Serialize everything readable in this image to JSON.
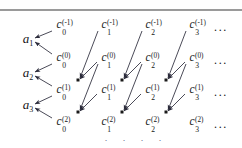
{
  "figure": {
    "width": 242,
    "height": 148,
    "background": "#ffffff",
    "rule_color": "#9a9a9a",
    "ink_color": "#161616",
    "arrow_color": "#2a2a3a"
  },
  "a_nodes": [
    {
      "id": "a1",
      "base": "a",
      "sub": "1",
      "x": 28,
      "y": 40
    },
    {
      "id": "a2",
      "base": "a",
      "sub": "2",
      "x": 28,
      "y": 74
    },
    {
      "id": "a3",
      "base": "a",
      "sub": "3",
      "x": 28,
      "y": 106
    }
  ],
  "c_columns": [
    {
      "col": 0,
      "x": 59
    },
    {
      "col": 1,
      "x": 104
    },
    {
      "col": 2,
      "x": 148
    },
    {
      "col": 3,
      "x": 192
    }
  ],
  "c_rows": [
    {
      "sup": "(-1)",
      "y": 25
    },
    {
      "sup": "(0)",
      "y": 58
    },
    {
      "sup": "(1)",
      "y": 90
    },
    {
      "sup": "(2)",
      "y": 122
    }
  ],
  "c_nodes": [
    {
      "id": "c0_-1",
      "base": "c",
      "sub": "0",
      "sup": "(-1)",
      "x": 59,
      "y": 25
    },
    {
      "id": "c1_-1",
      "base": "c",
      "sub": "1",
      "sup": "(-1)",
      "x": 104,
      "y": 25
    },
    {
      "id": "c2_-1",
      "base": "c",
      "sub": "2",
      "sup": "(-1)",
      "x": 148,
      "y": 25
    },
    {
      "id": "c3_-1",
      "base": "c",
      "sub": "3",
      "sup": "(-1)",
      "x": 192,
      "y": 25
    },
    {
      "id": "c0_0",
      "base": "c",
      "sub": "0",
      "sup": "(0)",
      "x": 59,
      "y": 58
    },
    {
      "id": "c1_0",
      "base": "c",
      "sub": "1",
      "sup": "(0)",
      "x": 104,
      "y": 58
    },
    {
      "id": "c2_0",
      "base": "c",
      "sub": "2",
      "sup": "(0)",
      "x": 148,
      "y": 58
    },
    {
      "id": "c3_0",
      "base": "c",
      "sub": "3",
      "sup": "(0)",
      "x": 192,
      "y": 58
    },
    {
      "id": "c0_1",
      "base": "c",
      "sub": "0",
      "sup": "(1)",
      "x": 59,
      "y": 90
    },
    {
      "id": "c1_1",
      "base": "c",
      "sub": "1",
      "sup": "(1)",
      "x": 104,
      "y": 90
    },
    {
      "id": "c2_1",
      "base": "c",
      "sub": "2",
      "sup": "(1)",
      "x": 148,
      "y": 90
    },
    {
      "id": "c3_1",
      "base": "c",
      "sub": "3",
      "sup": "(1)",
      "x": 192,
      "y": 90
    },
    {
      "id": "c0_2",
      "base": "c",
      "sub": "0",
      "sup": "(2)",
      "x": 59,
      "y": 122
    },
    {
      "id": "c1_2",
      "base": "c",
      "sub": "1",
      "sup": "(2)",
      "x": 104,
      "y": 122
    },
    {
      "id": "c2_2",
      "base": "c",
      "sub": "2",
      "sup": "(2)",
      "x": 148,
      "y": 122
    },
    {
      "id": "c3_2",
      "base": "c",
      "sub": "3",
      "sup": "(2)",
      "x": 192,
      "y": 122
    }
  ],
  "row_ellipses": [
    {
      "id": "ell-row--1",
      "text": "...",
      "x": 221,
      "y": 27
    },
    {
      "id": "ell-row-0",
      "text": "...",
      "x": 221,
      "y": 60
    },
    {
      "id": "ell-row-1",
      "text": "...",
      "x": 221,
      "y": 92
    },
    {
      "id": "ell-row-2",
      "text": "...",
      "x": 221,
      "y": 124
    }
  ],
  "bottom_dots": [
    {
      "id": "vdot-0",
      "text": "·",
      "x": 106,
      "y": 140
    },
    {
      "id": "vdot-1",
      "text": "·",
      "x": 124,
      "y": 140
    },
    {
      "id": "vdot-2",
      "text": "·",
      "x": 142,
      "y": 140
    },
    {
      "id": "vdot-3",
      "text": "·",
      "x": 160,
      "y": 140
    }
  ],
  "junctions": [
    {
      "id": "j-col0-row1",
      "x": 78,
      "y": 80
    },
    {
      "id": "j-col0-row2",
      "x": 78,
      "y": 112
    },
    {
      "id": "j-col1-row1",
      "x": 122,
      "y": 80
    },
    {
      "id": "j-col1-row2",
      "x": 122,
      "y": 112
    },
    {
      "id": "j-col2-row1",
      "x": 166,
      "y": 80
    },
    {
      "id": "j-col2-row2",
      "x": 166,
      "y": 112
    }
  ],
  "arrows": [
    {
      "id": "arr-c0m1-to-a1",
      "from": "c0_-1",
      "to": "a1",
      "x1": 52,
      "y1": 31,
      "x2": 35,
      "y2": 38
    },
    {
      "id": "arr-c00-to-a1",
      "from": "c0_0",
      "to": "a1",
      "x1": 52,
      "y1": 54,
      "x2": 35,
      "y2": 42
    },
    {
      "id": "arr-c00-to-a2",
      "from": "c0_0",
      "to": "a2",
      "x1": 52,
      "y1": 64,
      "x2": 35,
      "y2": 72
    },
    {
      "id": "arr-c01-to-a2",
      "from": "c0_1",
      "to": "a2",
      "x1": 52,
      "y1": 86,
      "x2": 35,
      "y2": 76
    },
    {
      "id": "arr-c01-to-a3",
      "from": "c0_1",
      "to": "a3",
      "x1": 52,
      "y1": 96,
      "x2": 35,
      "y2": 104
    },
    {
      "id": "arr-c02-to-a3",
      "from": "c0_2",
      "to": "a3",
      "x1": 52,
      "y1": 118,
      "x2": 35,
      "y2": 108
    },
    {
      "id": "arr-c1m1-to-j0r1",
      "from": "c1_-1",
      "to": "j-col0-row1",
      "x1": 98,
      "y1": 31,
      "x2": 80,
      "y2": 78
    },
    {
      "id": "arr-c10-to-j0r1",
      "from": "c1_0",
      "to": "j-col0-row1",
      "x1": 97,
      "y1": 62,
      "x2": 80,
      "y2": 79
    },
    {
      "id": "arr-c10-to-j0r2",
      "from": "c1_0",
      "to": "j-col0-row2",
      "x1": 98,
      "y1": 64,
      "x2": 80,
      "y2": 110
    },
    {
      "id": "arr-c11-to-j0r2",
      "from": "c1_1",
      "to": "j-col0-row2",
      "x1": 97,
      "y1": 94,
      "x2": 80,
      "y2": 111
    },
    {
      "id": "arr-c2m1-to-j1r1",
      "from": "c2_-1",
      "to": "j-col1-row1",
      "x1": 142,
      "y1": 31,
      "x2": 124,
      "y2": 78
    },
    {
      "id": "arr-c20-to-j1r1",
      "from": "c2_0",
      "to": "j-col1-row1",
      "x1": 141,
      "y1": 62,
      "x2": 124,
      "y2": 79
    },
    {
      "id": "arr-c20-to-j1r2",
      "from": "c2_0",
      "to": "j-col1-row2",
      "x1": 142,
      "y1": 64,
      "x2": 124,
      "y2": 110
    },
    {
      "id": "arr-c21-to-j1r2",
      "from": "c2_1",
      "to": "j-col1-row2",
      "x1": 141,
      "y1": 94,
      "x2": 124,
      "y2": 111
    },
    {
      "id": "arr-c3m1-to-j2r1",
      "from": "c3_-1",
      "to": "j-col2-row1",
      "x1": 186,
      "y1": 31,
      "x2": 168,
      "y2": 78
    },
    {
      "id": "arr-c30-to-j2r1",
      "from": "c3_0",
      "to": "j-col2-row1",
      "x1": 185,
      "y1": 62,
      "x2": 168,
      "y2": 79
    },
    {
      "id": "arr-c30-to-j2r2",
      "from": "c3_0",
      "to": "j-col2-row2",
      "x1": 186,
      "y1": 64,
      "x2": 168,
      "y2": 110
    },
    {
      "id": "arr-c31-to-j2r2",
      "from": "c3_1",
      "to": "j-col2-row2",
      "x1": 185,
      "y1": 94,
      "x2": 168,
      "y2": 111
    }
  ]
}
